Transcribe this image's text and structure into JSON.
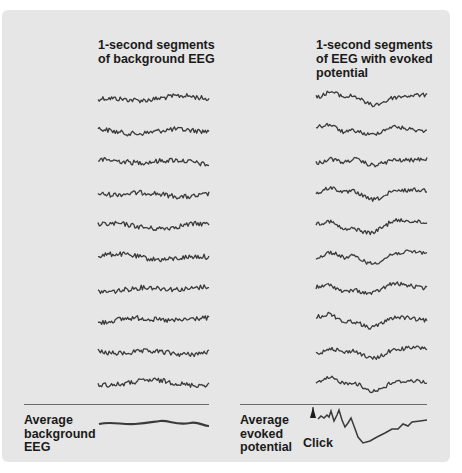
{
  "figure": {
    "left_column": {
      "heading_line1": "1-second segments",
      "heading_line2": "of background EEG",
      "trace_count": 10,
      "average_label_line1": "Average",
      "average_label_line2": "background",
      "average_label_line3": "EEG"
    },
    "right_column": {
      "heading_line1": "1-second segments",
      "heading_line2": "of EEG with evoked",
      "heading_line3": "potential",
      "trace_count": 10,
      "average_label_line1": "Average",
      "average_label_line2": "evoked",
      "average_label_line3": "potential",
      "stimulus_marker_label": "Click"
    },
    "colors": {
      "panel_background": "#e6e6e6",
      "trace": "#3a3a3a",
      "divider": "#6a6a6a",
      "text": "#1a1a1a"
    }
  }
}
